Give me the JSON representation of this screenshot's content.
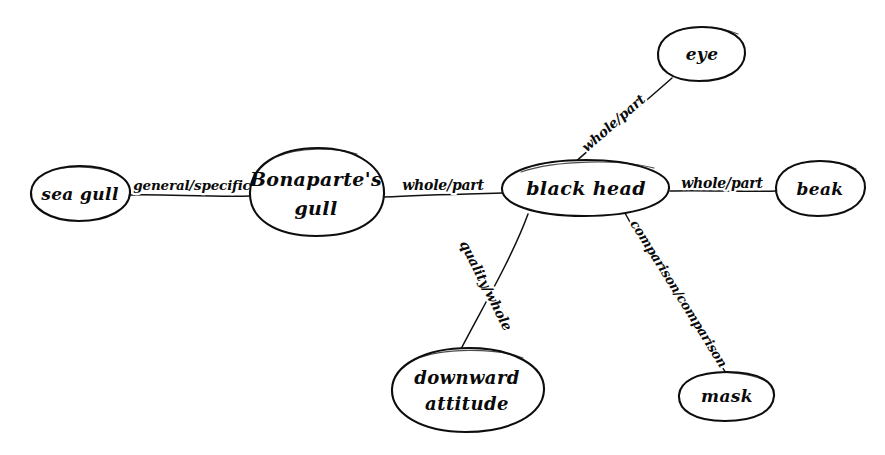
{
  "diagram": {
    "style": "hand-drawn",
    "background_color": "#ffffff",
    "ink_color": "#0a0a0a",
    "nodes": [
      {
        "id": "sea-gull",
        "label": "sea gull",
        "cx": 80,
        "cy": 193,
        "rx": 50,
        "ry": 27
      },
      {
        "id": "bonapartes-gull",
        "label_line1": "Bonaparte's",
        "label_line2": "gull",
        "cx": 316,
        "cy": 192,
        "rx": 68,
        "ry": 44
      },
      {
        "id": "black-head",
        "label": "black head",
        "cx": 585,
        "cy": 188,
        "rx": 85,
        "ry": 28
      },
      {
        "id": "beak",
        "label": "beak",
        "cx": 820,
        "cy": 188,
        "rx": 45,
        "ry": 27
      },
      {
        "id": "eye",
        "label": "eye",
        "cx": 701,
        "cy": 53,
        "rx": 44,
        "ry": 27
      },
      {
        "id": "downward-attitude",
        "label_line1": "downward",
        "label_line2": "attitude",
        "cx": 467,
        "cy": 390,
        "rx": 78,
        "ry": 43
      },
      {
        "id": "mask",
        "label": "mask",
        "cx": 726,
        "cy": 396,
        "rx": 48,
        "ry": 24
      }
    ],
    "edges": [
      {
        "id": "edge-sea-gull-bonapartes",
        "label": "general/specific",
        "from": "sea-gull",
        "to": "bonapartes-gull",
        "x1": 130,
        "y1": 195,
        "x2": 250,
        "y2": 196,
        "label_x": 192,
        "label_y": 186,
        "rotate": 0
      },
      {
        "id": "edge-bonapartes-black-head",
        "label": "whole/part",
        "from": "bonapartes-gull",
        "to": "black-head",
        "x1": 384,
        "y1": 197,
        "x2": 502,
        "y2": 193,
        "label_x": 443,
        "label_y": 186,
        "rotate": 0
      },
      {
        "id": "edge-black-head-beak",
        "label": "whole/part",
        "from": "black-head",
        "to": "beak",
        "x1": 670,
        "y1": 191,
        "x2": 776,
        "y2": 191,
        "label_x": 722,
        "label_y": 184,
        "rotate": 0
      },
      {
        "id": "edge-black-head-eye",
        "label": "whole/part",
        "from": "black-head",
        "to": "eye",
        "x1": 573,
        "y1": 164,
        "x2": 672,
        "y2": 77,
        "label_x": 614,
        "label_y": 124,
        "rotate": -41
      },
      {
        "id": "edge-black-head-downward",
        "label": "quality/whole",
        "from": "black-head",
        "to": "downward-attitude",
        "x1": 528,
        "y1": 214,
        "x2": 460,
        "y2": 349,
        "label_x": 485,
        "label_y": 286,
        "rotate": 63
      },
      {
        "id": "edge-black-head-mask",
        "label": "comparison/comparison",
        "from": "black-head",
        "to": "mask",
        "x1": 625,
        "y1": 213,
        "x2": 726,
        "y2": 373,
        "label_x": 678,
        "label_y": 294,
        "rotate": 58
      }
    ]
  }
}
